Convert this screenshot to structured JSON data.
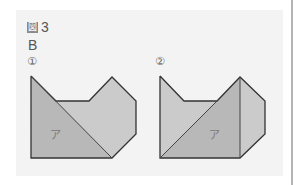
{
  "figure": {
    "title_kanji": "図",
    "title_number": "3",
    "set_label": "B"
  },
  "diagrams": [
    {
      "index_label": "①",
      "region_label": "ア",
      "colors": {
        "region": "#b8b8b8",
        "rest": "#cbcbcb",
        "stroke": "#333333"
      }
    },
    {
      "index_label": "②",
      "region_label": "ア",
      "colors": {
        "region": "#b8b8b8",
        "rest": "#cbcbcb",
        "stroke": "#333333"
      }
    }
  ],
  "colors": {
    "panel_bg": "#f3f3f3",
    "page_bg": "#ffffff",
    "rule": "#b4b4b4"
  }
}
